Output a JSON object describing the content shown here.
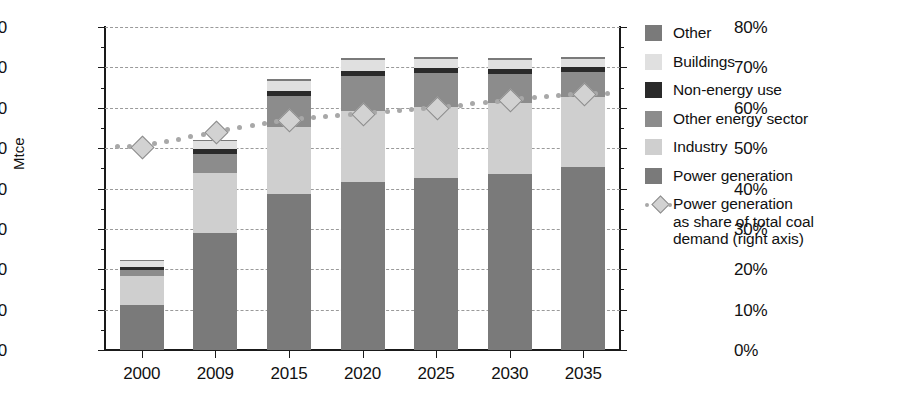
{
  "chart_data": {
    "type": "bar",
    "subtype": "stacked-bar-with-line-overlay",
    "title": "",
    "xlabel": "",
    "ylabel": "Mtce",
    "y2label": "",
    "ylim": [
      0,
      3200
    ],
    "y2lim": [
      0,
      80
    ],
    "ytick_step": 400,
    "y2tick_step": 10,
    "grid": true,
    "legend_position": "right",
    "categories": [
      "2000",
      "2009",
      "2015",
      "2020",
      "2025",
      "2030",
      "2035"
    ],
    "yticks": [
      "0",
      "400",
      "800",
      "1200",
      "1600",
      "2000",
      "2400",
      "2800",
      "3200"
    ],
    "y2ticks": [
      "0%",
      "10%",
      "20%",
      "30%",
      "40%",
      "50%",
      "60%",
      "70%",
      "80%"
    ],
    "series": [
      {
        "name": "Power generation",
        "color": "#7a7a7a",
        "stack_order": 1,
        "values": [
          450,
          1160,
          1545,
          1660,
          1700,
          1745,
          1815
        ]
      },
      {
        "name": "Industry",
        "color": "#cfcfcf",
        "stack_order": 2,
        "values": [
          285,
          590,
          660,
          710,
          710,
          705,
          690
        ]
      },
      {
        "name": "Other energy sector",
        "color": "#8c8c8c",
        "stack_order": 3,
        "values": [
          60,
          195,
          310,
          345,
          330,
          285,
          245
        ]
      },
      {
        "name": "Non-energy use",
        "color": "#2a2a2a",
        "stack_order": 4,
        "values": [
          25,
          45,
          50,
          50,
          50,
          50,
          50
        ]
      },
      {
        "name": "Buildings",
        "color": "#e0e0e0",
        "stack_order": 5,
        "values": [
          60,
          80,
          100,
          105,
          95,
          90,
          85
        ]
      },
      {
        "name": "Other",
        "color": "#7a7a7a",
        "stack_order": 6,
        "values": [
          10,
          15,
          20,
          20,
          20,
          20,
          20
        ]
      }
    ],
    "totals": [
      890,
      2085,
      2685,
      2890,
      2905,
      2895,
      2905
    ],
    "line_series": {
      "name": "Power generation as share of total coal demand (right axis)",
      "axis": "right",
      "unit": "%",
      "color": "#a8a8a8",
      "marker": "diamond",
      "style": "dotted",
      "values": [
        50.5,
        54.0,
        57.0,
        58.5,
        60.0,
        62.0,
        63.5
      ]
    }
  },
  "axes": {
    "left_title": "Mtce",
    "left_ticks": [
      "3200",
      "2800",
      "2400",
      "2000",
      "1600",
      "1200",
      "800",
      "400",
      "0"
    ],
    "right_ticks": [
      "80%",
      "70%",
      "60%",
      "50%",
      "40%",
      "30%",
      "20%",
      "10%",
      "0%"
    ],
    "x_ticks": [
      "2000",
      "2009",
      "2015",
      "2020",
      "2025",
      "2030",
      "2035"
    ]
  },
  "legend": {
    "items": [
      {
        "label": "Other",
        "color": "#7a7a7a",
        "swatch": "square-swatch"
      },
      {
        "label": "Buildings",
        "color": "#e0e0e0",
        "swatch": "square-swatch"
      },
      {
        "label": "Non-energy use",
        "color": "#2a2a2a",
        "swatch": "square-swatch"
      },
      {
        "label": "Other energy sector",
        "color": "#8c8c8c",
        "swatch": "square-swatch"
      },
      {
        "label": "Industry",
        "color": "#cfcfcf",
        "swatch": "square-swatch"
      },
      {
        "label": "Power generation",
        "color": "#7a7a7a",
        "swatch": "square-swatch"
      }
    ],
    "line_item": {
      "line1": "Power generation",
      "line2": "as share of total coal",
      "line3": "demand (right axis)",
      "marker_color": "#d2d2d2",
      "line_color": "#a8a8a8"
    }
  },
  "colors": {
    "background": "#ffffff",
    "axis": "#1a1a1a",
    "grid": "#9a9a9a",
    "text": "#111111"
  }
}
